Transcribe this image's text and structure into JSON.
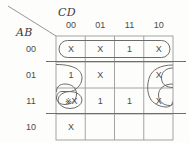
{
  "diagram": {
    "type": "karnaugh-map",
    "corner": {
      "col_var_label": "CD",
      "row_var_label": "AB"
    },
    "columns": {
      "headers": [
        "00",
        "01",
        "11",
        "10"
      ]
    },
    "rows": {
      "headers": [
        "00",
        "01",
        "11",
        "10"
      ]
    },
    "cells": [
      {
        "row": "00",
        "col": "00",
        "value": "X",
        "marked": false
      },
      {
        "row": "00",
        "col": "01",
        "value": "X",
        "marked": false
      },
      {
        "row": "00",
        "col": "11",
        "value": "1",
        "marked": false
      },
      {
        "row": "00",
        "col": "10",
        "value": "X",
        "marked": false
      },
      {
        "row": "01",
        "col": "00",
        "value": "1",
        "marked": false
      },
      {
        "row": "01",
        "col": "01",
        "value": "X",
        "marked": false
      },
      {
        "row": "01",
        "col": "11",
        "value": "",
        "marked": false
      },
      {
        "row": "01",
        "col": "10",
        "value": "X",
        "marked": false
      },
      {
        "row": "11",
        "col": "00",
        "value": "X",
        "marked": true,
        "mark": "※"
      },
      {
        "row": "11",
        "col": "01",
        "value": "1",
        "marked": false
      },
      {
        "row": "11",
        "col": "11",
        "value": "1",
        "marked": false
      },
      {
        "row": "11",
        "col": "10",
        "value": "X",
        "marked": false
      },
      {
        "row": "10",
        "col": "00",
        "value": "X",
        "marked": false
      },
      {
        "row": "10",
        "col": "01",
        "value": "",
        "marked": false
      },
      {
        "row": "10",
        "col": "11",
        "value": "",
        "marked": false
      },
      {
        "row": "10",
        "col": "10",
        "value": "",
        "marked": false
      }
    ],
    "groups": [
      {
        "id": "group-row-00",
        "shape": "oval-horizontal",
        "covers": "row 00, all columns"
      },
      {
        "id": "group-left-wrap",
        "shape": "oval-curved",
        "covers": "column 00, rows 01 and 11"
      },
      {
        "id": "group-right-wrap",
        "shape": "oval-vertical",
        "covers": "column 10, rows 01 and 11"
      }
    ],
    "rules": [
      {
        "id": "rule-row00-row01",
        "position": "between row 00 and row 01"
      },
      {
        "id": "rule-row11-row10",
        "position": "between row 11 and row 10"
      }
    ],
    "colors": {
      "ink": "#4a4a4a",
      "grid": "#8f8f8f",
      "oval": "#6b6b6b",
      "background": "#fdfdfc"
    }
  }
}
